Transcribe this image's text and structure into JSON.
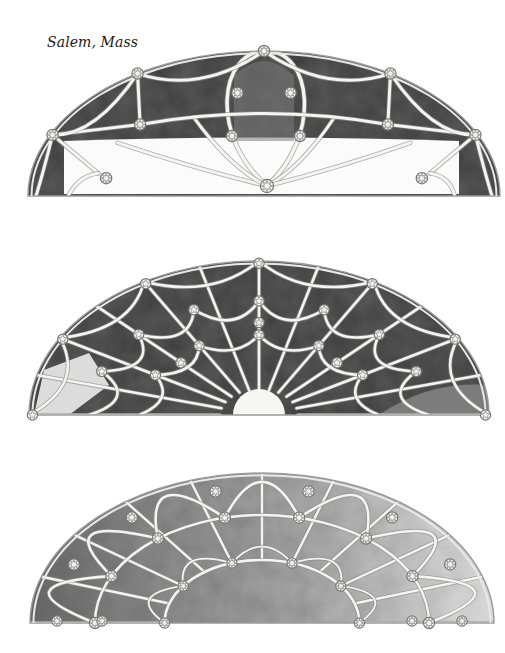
{
  "caption": "Salem, Mass",
  "colors": {
    "paper": "#ffffff",
    "ink": "#6b6b6b",
    "lead": "#f4f4f2",
    "lead_edge": "#8a8a8a",
    "glass_dark": "#5a5a5a",
    "glass_mid": "#7c7c7c",
    "glass_light": "#b9b9b9",
    "glass_pale": "#dcdcdc"
  },
  "fanlights": [
    {
      "name": "fanlight-top",
      "cx": 264,
      "base_y": 196,
      "rx": 236,
      "ry": 145,
      "shade": "glass_dark",
      "pattern": "ellipse-web",
      "lower_clear": true
    },
    {
      "name": "fanlight-middle",
      "cx": 259,
      "base_y": 415,
      "rx": 230,
      "ry": 154,
      "shade": "glass_dark",
      "pattern": "spider-web",
      "hub_r": 26
    },
    {
      "name": "fanlight-bottom",
      "cx": 262,
      "base_y": 623,
      "rx": 232,
      "ry": 150,
      "shade": "glass_mid",
      "pattern": "petal-rosette",
      "hub_r": 58
    }
  ]
}
